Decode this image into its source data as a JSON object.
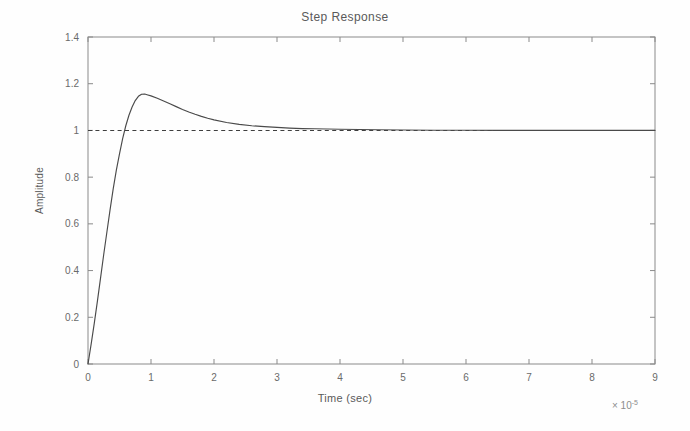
{
  "chart_data": {
    "type": "line",
    "title": "Step Response",
    "xlabel": "Time (sec)",
    "ylabel": "Amplitude",
    "x_multiplier_prefix": "× 10",
    "x_multiplier_exponent": "-5",
    "xlim": [
      0,
      9
    ],
    "ylim": [
      0,
      1.4
    ],
    "xticks": [
      0,
      1,
      2,
      3,
      4,
      5,
      6,
      7,
      8,
      9
    ],
    "xticklabels": [
      "0",
      "1",
      "2",
      "3",
      "4",
      "5",
      "6",
      "7",
      "8",
      "9"
    ],
    "yticks": [
      0,
      0.2,
      0.4,
      0.6,
      0.8,
      1,
      1.2,
      1.4
    ],
    "yticklabels": [
      "0",
      "0.2",
      "0.4",
      "0.6",
      "0.8",
      "1",
      "1.2",
      "1.4"
    ],
    "grid": false,
    "legend": "none",
    "box": true,
    "tick_direction": "in",
    "axis_color": "#7a7a7a",
    "curve_color": "#4a4a4a",
    "reference_color": "#3a3a3a",
    "background_color": "#fefefe",
    "series": [
      {
        "name": "Step Response",
        "style": "solid",
        "peak_value": 1.155,
        "peak_time": 0.85,
        "final_value": 1.0,
        "x": [
          0,
          0.05,
          0.1,
          0.15,
          0.2,
          0.25,
          0.3,
          0.35,
          0.4,
          0.45,
          0.5,
          0.55,
          0.6,
          0.65,
          0.7,
          0.75,
          0.8,
          0.85,
          0.9,
          0.95,
          1.0,
          1.1,
          1.2,
          1.3,
          1.4,
          1.5,
          1.6,
          1.7,
          1.8,
          1.9,
          2.0,
          2.2,
          2.4,
          2.6,
          2.8,
          3.0,
          3.2,
          3.4,
          3.6,
          3.8,
          4.0,
          4.3,
          4.6,
          5.0,
          5.5,
          6.0,
          6.5,
          7.0,
          7.5,
          8.0,
          8.5,
          9.0
        ],
        "y": [
          0,
          0.085,
          0.175,
          0.27,
          0.37,
          0.47,
          0.565,
          0.66,
          0.75,
          0.83,
          0.9,
          0.965,
          1.02,
          1.065,
          1.1,
          1.128,
          1.146,
          1.155,
          1.156,
          1.152,
          1.148,
          1.138,
          1.126,
          1.114,
          1.102,
          1.09,
          1.079,
          1.069,
          1.06,
          1.052,
          1.045,
          1.034,
          1.026,
          1.02,
          1.016,
          1.013,
          1.01,
          1.008,
          1.007,
          1.006,
          1.005,
          1.004,
          1.003,
          1.002,
          1.001,
          1.001,
          1.0,
          1.0,
          1.0,
          1.0,
          1.0,
          1.0
        ]
      },
      {
        "name": "Reference",
        "style": "dashed",
        "value": 1.0
      }
    ]
  },
  "chart": {
    "title": "Step Response",
    "ylabel": "Amplitude",
    "xlabel": "Time (sec)",
    "multiplier_prefix": "× 10",
    "multiplier_exponent": "-5"
  }
}
